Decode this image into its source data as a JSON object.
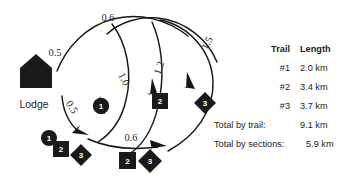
{
  "diagram": {
    "lodge_label": "Lodge",
    "lodge_icon": "house-icon",
    "edges": [
      {
        "id": "e-top-06",
        "label": "0.6"
      },
      {
        "id": "e-left-05",
        "label": "0.5"
      },
      {
        "id": "e-lower-05",
        "label": "0.5"
      },
      {
        "id": "e-mid-10",
        "label": "1.0"
      },
      {
        "id": "e-mid-12",
        "label": "1.2"
      },
      {
        "id": "e-right-15",
        "label": "1.5"
      },
      {
        "id": "e-bottom-06",
        "label": "0.6"
      }
    ],
    "nodes": [
      {
        "id": "node-center-circle-1",
        "shape": "circle",
        "label": "1"
      },
      {
        "id": "node-mid-square-2",
        "shape": "square",
        "label": "2"
      },
      {
        "id": "node-right-diamond-3",
        "shape": "diamond",
        "label": "3"
      },
      {
        "id": "node-bl-circle-1",
        "shape": "circle",
        "label": "1"
      },
      {
        "id": "node-bl-square-2",
        "shape": "square",
        "label": "2"
      },
      {
        "id": "node-bl-diamond-3",
        "shape": "diamond",
        "label": "3"
      },
      {
        "id": "node-bm-square-2",
        "shape": "square",
        "label": "2"
      },
      {
        "id": "node-bm-diamond-3",
        "shape": "diamond",
        "label": "3"
      }
    ]
  },
  "legend": {
    "header": {
      "trail": "Trail",
      "length": "Length"
    },
    "rows": [
      {
        "trail": "#1",
        "length": "2.0 km"
      },
      {
        "trail": "#2",
        "length": "3.4 km"
      },
      {
        "trail": "#3",
        "length": "3.7 km"
      }
    ],
    "totals": [
      {
        "label": "Total by trail:",
        "value": "9.1 km"
      },
      {
        "label": "Total by sections:",
        "value": "5.9 km"
      }
    ]
  },
  "colors": {
    "ink": "#161616",
    "marker_fill": "#1a1a1a",
    "marker_text": "#ffffff",
    "background": "#ffffff"
  }
}
